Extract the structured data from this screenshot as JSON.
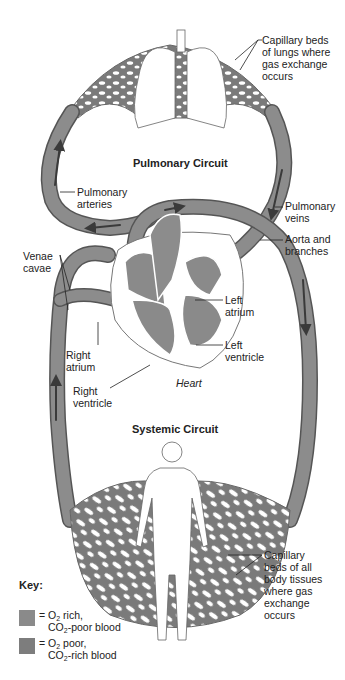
{
  "diagram": {
    "circuits": {
      "pulmonary": "Pulmonary Circuit",
      "systemic": "Systemic Circuit"
    },
    "labels": {
      "capillary_lungs": [
        "Capillary beds",
        "of lungs where",
        "gas exchange",
        "occurs"
      ],
      "pulmonary_arteries": [
        "Pulmonary",
        "arteries"
      ],
      "pulmonary_veins": [
        "Pulmonary",
        "veins"
      ],
      "aorta": [
        "Aorta and",
        "branches"
      ],
      "venae_cavae": [
        "Venae",
        "cavae"
      ],
      "left_atrium": [
        "Left",
        "atrium"
      ],
      "left_ventricle": [
        "Left",
        "ventricle"
      ],
      "right_atrium": [
        "Right",
        "atrium"
      ],
      "right_ventricle": [
        "Right",
        "ventricle"
      ],
      "heart": "Heart",
      "capillary_body": [
        "Capillary",
        "beds of all",
        "body tissues",
        "where gas",
        "exchange",
        "occurs"
      ]
    },
    "key": {
      "title": "Key:",
      "items": [
        {
          "eq": "= ",
          "line1_a": "O",
          "line1_sub": "2",
          "line1_b": " rich,",
          "line2_a": "CO",
          "line2_sub": "2",
          "line2_b": "-poor blood",
          "color": "#8a8a8a"
        },
        {
          "eq": "= ",
          "line1_a": "O",
          "line1_sub": "2",
          "line1_b": " poor,",
          "line2_a": "CO",
          "line2_sub": "2",
          "line2_b": "-rich blood",
          "color": "#7d7d7d"
        }
      ]
    },
    "colors": {
      "vessel": "#8c8c8c",
      "vessel_dark": "#6f6f6f",
      "arrow": "#3a3a3a",
      "outline": "#555555"
    }
  }
}
